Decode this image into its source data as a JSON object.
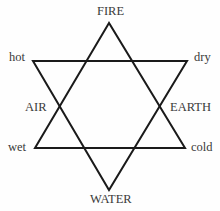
{
  "diagram": {
    "type": "hexagram",
    "stroke_color": "#1a1a1a",
    "label_color": "#3a3a3a",
    "elements": {
      "top": "FIRE",
      "bottom": "WATER",
      "left": "AIR",
      "right": "EARTH"
    },
    "qualities": {
      "top_left": "hot",
      "top_right": "dry",
      "bottom_left": "wet",
      "bottom_right": "cold"
    },
    "triangles": {
      "upward": [
        [
          109,
          23
        ],
        [
          35,
          148
        ],
        [
          185,
          148
        ]
      ],
      "downward": [
        [
          33,
          61
        ],
        [
          187,
          61
        ],
        [
          109,
          190
        ]
      ]
    }
  }
}
